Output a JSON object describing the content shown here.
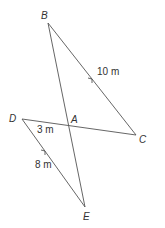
{
  "diagram": {
    "type": "geometry",
    "points": {
      "B": {
        "label": "B",
        "x": 48,
        "y": 23
      },
      "C": {
        "label": "C",
        "x": 136,
        "y": 135
      },
      "D": {
        "label": "D",
        "x": 22,
        "y": 119
      },
      "E": {
        "label": "E",
        "x": 85,
        "y": 207
      },
      "A": {
        "label": "A",
        "x": 70,
        "y": 126
      }
    },
    "segments": [
      {
        "from": "B",
        "to": "C",
        "length_label": "10 m",
        "parallel_arrow": true
      },
      {
        "from": "D",
        "to": "E",
        "length_label": "8 m",
        "parallel_arrow": true
      },
      {
        "from": "B",
        "to": "E",
        "length_label": ""
      },
      {
        "from": "D",
        "to": "C",
        "length_label": ""
      },
      {
        "from": "D",
        "to": "A",
        "length_label": "3 m"
      }
    ],
    "labels": {
      "B": "B",
      "A": "A",
      "C": "C",
      "D": "D",
      "E": "E",
      "bc_length": "10 m",
      "da_length": "3 m",
      "de_length": "8 m"
    },
    "colors": {
      "line": "#555555",
      "text": "#333333"
    }
  }
}
